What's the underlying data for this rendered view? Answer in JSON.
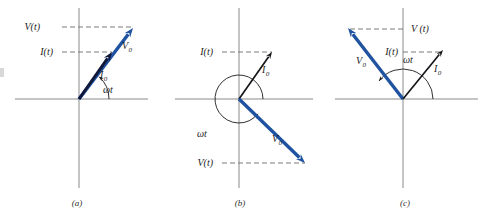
{
  "figure": {
    "panel_count": 3,
    "colors": {
      "voltage_phasor": "#1f52a0",
      "current_phasor": "#10193a",
      "axis": "#8a8a8a",
      "dashed": "#7a7a7a",
      "text": "#1c1c1c"
    },
    "labels": {
      "voltage_amplitude": "V",
      "current_amplitude": "I",
      "amplitude_subscript": "0",
      "voltage_instant": "V(t)",
      "current_instant": "I(t)",
      "angle": "ωt"
    }
  },
  "panels": [
    {
      "id": "a",
      "caption": "(a)",
      "caption_x": 77,
      "caption_y": 206,
      "origin": {
        "x": 79,
        "y": 99
      },
      "axes": {
        "x": {
          "x1": 15,
          "y1": 99,
          "x2": 148,
          "y2": 99
        },
        "y": {
          "x1": 79,
          "y1": 8,
          "x2": 79,
          "y2": 188
        }
      },
      "phasors": [
        {
          "name": "voltage-phasor",
          "label": "V",
          "sub": "0",
          "color": "#1f52a0",
          "kind": "blue",
          "angle_deg": 48,
          "tip": {
            "x": 133,
            "y": 28
          },
          "label_pos": {
            "x": 122,
            "y": 49
          }
        },
        {
          "name": "current-phasor",
          "label": "I",
          "sub": "0",
          "color": "#10193a",
          "kind": "dark",
          "angle_deg": 48,
          "tip": {
            "x": 112,
            "y": 52
          },
          "label_pos": {
            "x": 100,
            "y": 78
          }
        }
      ],
      "dashed": [
        {
          "name": "voltage-projection",
          "x1": 62,
          "y1": 27,
          "x2": 133,
          "y2": 27,
          "label": "V(t)",
          "label_x": 40,
          "label_y": 30,
          "anchor": "end"
        },
        {
          "name": "current-projection",
          "x1": 62,
          "y1": 52,
          "x2": 112,
          "y2": 52,
          "label": "I(t)",
          "label_x": 53,
          "label_y": 55,
          "anchor": "end"
        }
      ],
      "arc": {
        "name": "omega-t-arc",
        "radius": 30,
        "start_deg": 0,
        "end_deg": 48,
        "arrow_at": "end",
        "label": "ωt",
        "label_x": 103,
        "label_y": 93
      },
      "phase_note": "V and I in phase"
    },
    {
      "id": "b",
      "caption": "(b)",
      "caption_x": 240,
      "caption_y": 206,
      "origin": {
        "x": 239,
        "y": 99
      },
      "axes": {
        "x": {
          "x1": 175,
          "y1": 99,
          "x2": 313,
          "y2": 99
        },
        "y": {
          "x1": 239,
          "y1": 8,
          "x2": 239,
          "y2": 188
        }
      },
      "phasors": [
        {
          "name": "current-phasor",
          "label": "I",
          "sub": "0",
          "color": "#16161a",
          "kind": "black",
          "angle_deg": 55,
          "tip": {
            "x": 272,
            "y": 52
          },
          "label_pos": {
            "x": 262,
            "y": 73
          }
        },
        {
          "name": "voltage-phasor",
          "label": "V",
          "sub": "0",
          "color": "#1f52a0",
          "kind": "blue",
          "angle_deg": -38,
          "tip": {
            "x": 305,
            "y": 163
          },
          "label_pos": {
            "x": 272,
            "y": 142
          }
        }
      ],
      "dashed": [
        {
          "name": "current-projection",
          "x1": 222,
          "y1": 52,
          "x2": 272,
          "y2": 52,
          "label": "I(t)",
          "label_x": 213,
          "label_y": 55,
          "anchor": "end"
        },
        {
          "name": "voltage-projection",
          "x1": 222,
          "y1": 163,
          "x2": 305,
          "y2": 163,
          "label": "V(t)",
          "label_x": 213,
          "label_y": 166,
          "anchor": "end"
        }
      ],
      "arc": {
        "name": "omega-t-arc",
        "radius": 24,
        "start_deg": 0,
        "end_deg": 322,
        "arrow_at": "end",
        "label": "ωt",
        "label_x": 197,
        "label_y": 137
      },
      "phase_note": "V lags I"
    },
    {
      "id": "c",
      "caption": "(c)",
      "caption_x": 405,
      "caption_y": 206,
      "origin": {
        "x": 403,
        "y": 99
      },
      "axes": {
        "x": {
          "x1": 335,
          "y1": 99,
          "x2": 478,
          "y2": 99
        },
        "y": {
          "x1": 403,
          "y1": 8,
          "x2": 403,
          "y2": 188
        }
      },
      "phasors": [
        {
          "name": "voltage-phasor",
          "label": "V",
          "sub": "0",
          "color": "#1f52a0",
          "kind": "blue",
          "angle_deg": 143,
          "tip": {
            "x": 348,
            "y": 28
          },
          "label_pos": {
            "x": 356,
            "y": 64
          }
        },
        {
          "name": "current-phasor",
          "label": "I",
          "sub": "0",
          "color": "#16161a",
          "kind": "black",
          "angle_deg": 55,
          "tip": {
            "x": 443,
            "y": 50
          },
          "label_pos": {
            "x": 434,
            "y": 72
          }
        }
      ],
      "dashed": [
        {
          "name": "voltage-projection",
          "x1": 350,
          "y1": 29,
          "x2": 403,
          "y2": 29,
          "label": "V (t)",
          "label_x": 411,
          "label_y": 32,
          "anchor": "start"
        },
        {
          "name": "current-projection",
          "x1": 403,
          "y1": 52,
          "x2": 443,
          "y2": 52,
          "label": "I(t)",
          "label_x": 398,
          "label_y": 55,
          "anchor": "end"
        }
      ],
      "arc": {
        "name": "omega-t-arc",
        "radius": 30,
        "start_deg": 0,
        "end_deg": 143,
        "arrow_at": "end",
        "label": "ωt",
        "label_x": 403,
        "label_y": 63
      },
      "phase_note": "V leads I"
    }
  ]
}
